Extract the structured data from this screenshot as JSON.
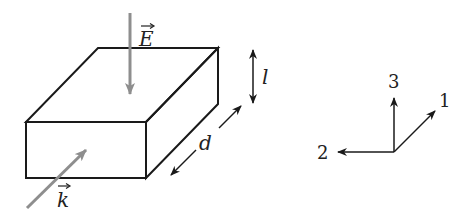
{
  "diagram": {
    "type": "3D slab with field vectors and coordinate axes",
    "colors": {
      "outline": "#1a1a1a",
      "vector": "#8e8e8e",
      "text": "#222222"
    },
    "labels": {
      "electric_field": "E",
      "wave_vector": "k",
      "thickness": "l",
      "length": "d",
      "axis_1": "1",
      "axis_2": "2",
      "axis_3": "3"
    }
  }
}
